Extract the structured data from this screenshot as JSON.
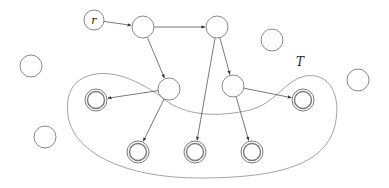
{
  "diagram": {
    "root_label": "r",
    "set_label": "T",
    "stroke_color": "#7a7a7a",
    "nodes": [
      {
        "id": "r",
        "x": 94,
        "y": 20,
        "label": "r",
        "type": "root"
      },
      {
        "id": "a",
        "x": 143,
        "y": 27,
        "type": "internal"
      },
      {
        "id": "b",
        "x": 217,
        "y": 27,
        "type": "internal"
      },
      {
        "id": "c",
        "x": 169,
        "y": 89,
        "type": "internal"
      },
      {
        "id": "d",
        "x": 233,
        "y": 86,
        "type": "internal"
      },
      {
        "id": "t1",
        "x": 96,
        "y": 100,
        "type": "terminal"
      },
      {
        "id": "t2",
        "x": 303,
        "y": 100,
        "type": "terminal"
      },
      {
        "id": "t3",
        "x": 138,
        "y": 152,
        "type": "terminal"
      },
      {
        "id": "t4",
        "x": 195,
        "y": 152,
        "type": "terminal"
      },
      {
        "id": "t5",
        "x": 252,
        "y": 152,
        "type": "terminal"
      },
      {
        "id": "i1",
        "x": 31,
        "y": 66,
        "type": "isolated"
      },
      {
        "id": "i2",
        "x": 272,
        "y": 40,
        "type": "isolated"
      },
      {
        "id": "i3",
        "x": 358,
        "y": 80,
        "type": "isolated"
      },
      {
        "id": "i4",
        "x": 45,
        "y": 137,
        "type": "isolated"
      }
    ],
    "edges": [
      {
        "from": "r",
        "to": "a"
      },
      {
        "from": "a",
        "to": "b"
      },
      {
        "from": "a",
        "to": "c"
      },
      {
        "from": "b",
        "to": "d"
      },
      {
        "from": "b",
        "to": "t4"
      },
      {
        "from": "c",
        "to": "t1"
      },
      {
        "from": "c",
        "to": "t3"
      },
      {
        "from": "d",
        "to": "t2"
      },
      {
        "from": "d",
        "to": "t5"
      }
    ]
  }
}
